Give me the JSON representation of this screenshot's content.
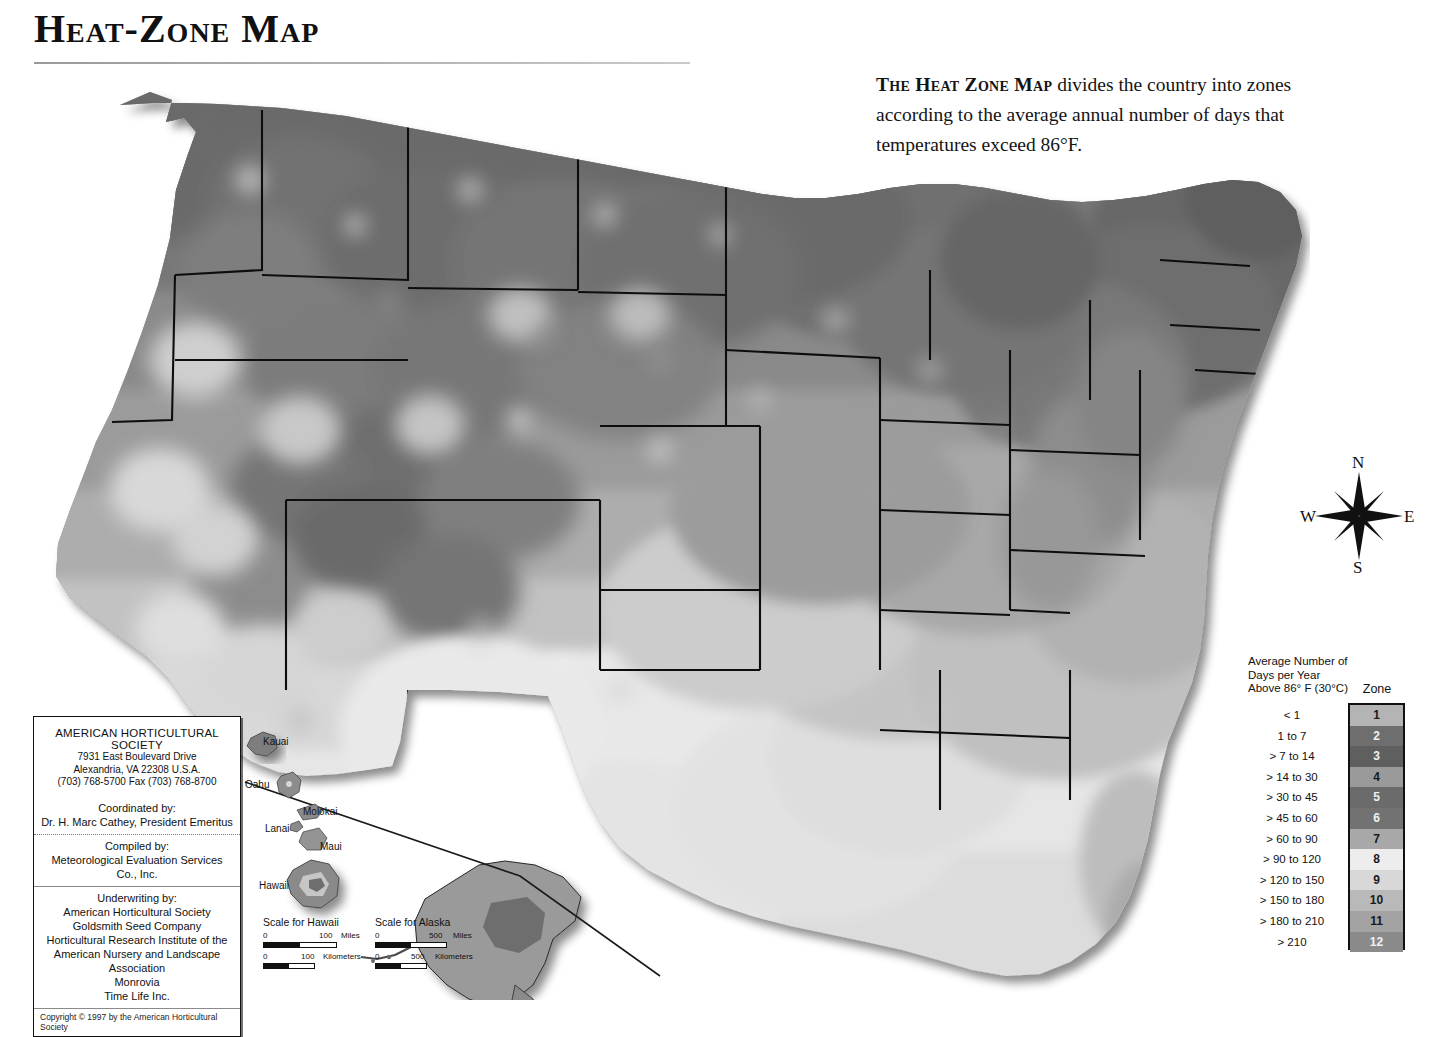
{
  "title": "Heat-Zone Map",
  "intro": {
    "lead": "The Heat Zone Map",
    "body": " divides the country into zones according to the average annual number of days that temperatures exceed 86°F."
  },
  "compass": {
    "north": "N",
    "south": "S",
    "east": "E",
    "west": "W"
  },
  "legend": {
    "title": "Average Number of Days per Year Above 86° F (30°C)",
    "zone_header": "Zone",
    "entries": [
      {
        "zone": "1",
        "range": "< 1",
        "color": "#b4b4b4"
      },
      {
        "zone": "2",
        "range": "1 to 7",
        "color": "#6e6e6e"
      },
      {
        "zone": "3",
        "range": "> 7 to 14",
        "color": "#5f5f5f"
      },
      {
        "zone": "4",
        "range": "> 14 to 30",
        "color": "#9a9a9a"
      },
      {
        "zone": "5",
        "range": "> 30 to 45",
        "color": "#6b6b6b"
      },
      {
        "zone": "6",
        "range": "> 45 to 60",
        "color": "#727272"
      },
      {
        "zone": "7",
        "range": "> 60 to 90",
        "color": "#a8a8a8"
      },
      {
        "zone": "8",
        "range": "> 90 to 120",
        "color": "#ededed"
      },
      {
        "zone": "9",
        "range": "> 120 to 150",
        "color": "#d8d8d8"
      },
      {
        "zone": "10",
        "range": "> 150 to 180",
        "color": "#b9b9b9"
      },
      {
        "zone": "11",
        "range": "> 180 to 210",
        "color": "#a3a3a3"
      },
      {
        "zone": "12",
        "range": "> 210",
        "color": "#8a8a8a"
      }
    ]
  },
  "credits": {
    "organization": "AMERICAN HORTICULTURAL SOCIETY",
    "address_line1": "7931 East Boulevard Drive",
    "address_line2": "Alexandria, VA 22308 U.S.A.",
    "phone": "(703) 768-5700 Fax (703) 768-8700",
    "coordinated_label": "Coordinated by:",
    "coordinated_name": "Dr. H. Marc Cathey, President Emeritus",
    "compiled_label": "Compiled by:",
    "compiled_name": "Meteorological Evaluation Services Co., Inc.",
    "underwriting_label": "Underwriting by:",
    "underwriters": [
      "American Horticultural Society",
      "Goldsmith Seed Company",
      "Horticultural Research Institute of the",
      "American Nursery and Landscape Association",
      "Monrovia",
      "Time Life Inc."
    ],
    "copyright": "Copyright © 1997 by the American Horticultural Society"
  },
  "hawaii": {
    "islands": [
      "Kauai",
      "Oahu",
      "Molokai",
      "Lanai",
      "Maui",
      "Hawaii"
    ]
  },
  "scales": [
    {
      "title": "Scale for Hawaii",
      "miles_zero": "0",
      "miles_max": "100",
      "miles_unit": "Miles",
      "km_zero": "0",
      "km_max": "100",
      "km_unit": "Kilometers"
    },
    {
      "title": "Scale for Alaska",
      "miles_zero": "0",
      "miles_max": "500",
      "miles_unit": "Miles",
      "km_zero": "0",
      "km_max": "500",
      "km_unit": "Kilometers"
    }
  ]
}
